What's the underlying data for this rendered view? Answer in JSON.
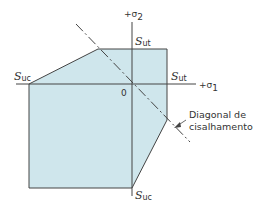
{
  "diagram": {
    "type": "failure-envelope",
    "colors": {
      "region_fill": "#cfe6ec",
      "stroke": "#444444",
      "text": "#333333"
    },
    "axes": {
      "x_label": "+σ",
      "x_sub": "1",
      "y_label": "+σ",
      "y_sub": "2",
      "origin_label": "0"
    },
    "labels": {
      "sut_top": {
        "main": "S",
        "sub": "ut"
      },
      "sut_right": {
        "main": "S",
        "sub": "ut"
      },
      "suc_left": {
        "main": "S",
        "sub": "uc"
      },
      "suc_bottom": {
        "main": "S",
        "sub": "uc"
      }
    },
    "annotation": {
      "line1": "Diagonal de",
      "line2": "cisalhamento"
    }
  }
}
